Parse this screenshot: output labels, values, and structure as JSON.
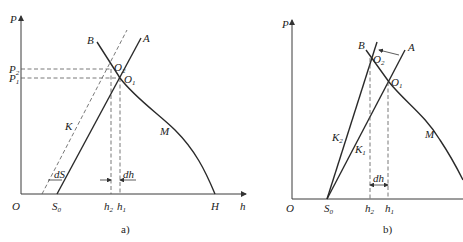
{
  "figure": {
    "panels": [
      {
        "id": "a",
        "caption": "a)",
        "axes": {
          "y_label": "P",
          "x_label": "h",
          "origin_label": "O"
        },
        "y_ticks": [
          {
            "label": "P",
            "sub": "2"
          },
          {
            "label": "P",
            "sub": "1"
          }
        ],
        "x_ticks": [
          {
            "label": "S",
            "sub": "0"
          },
          {
            "label": "h",
            "sub": "2"
          },
          {
            "label": "h",
            "sub": "1"
          },
          {
            "label": "H",
            "sub": ""
          }
        ],
        "points": [
          {
            "label": "O",
            "sub": "2"
          },
          {
            "label": "O",
            "sub": "1"
          }
        ],
        "line_labels": {
          "B": "B",
          "A": "A",
          "K": "K",
          "M": "M"
        },
        "annotations": {
          "dS": "dS",
          "dh": "dh"
        }
      },
      {
        "id": "b",
        "caption": "b)",
        "axes": {
          "y_label": "P",
          "x_label": "h",
          "origin_label": "O"
        },
        "x_ticks": [
          {
            "label": "S",
            "sub": "0"
          },
          {
            "label": "h",
            "sub": "2"
          },
          {
            "label": "h",
            "sub": "1"
          }
        ],
        "points": [
          {
            "label": "O",
            "sub": "2"
          },
          {
            "label": "O",
            "sub": "1"
          }
        ],
        "line_labels": {
          "B": "B",
          "A": "A",
          "K2": "K",
          "K2_sub": "2",
          "K1": "K",
          "K1_sub": "1",
          "M": "M"
        },
        "annotations": {
          "dh": "dh"
        }
      }
    ]
  }
}
